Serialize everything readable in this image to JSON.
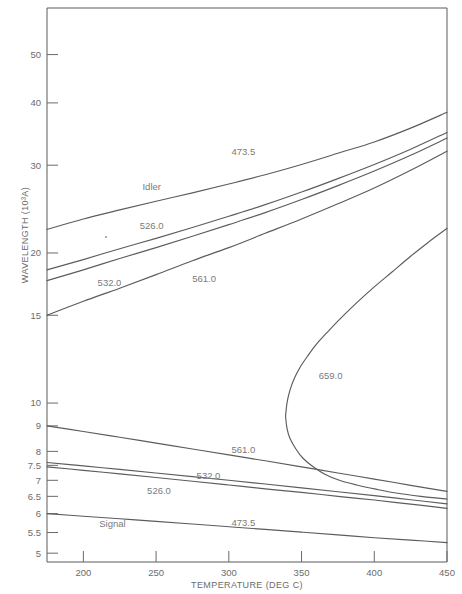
{
  "chart_data": {
    "type": "line",
    "title": "",
    "xlabel": "TEMPERATURE (DEG C)",
    "ylabel": "WAVELENGTH (10³A)",
    "xlim": [
      175,
      450
    ],
    "ylim": [
      4.8,
      62
    ],
    "yscale": "log",
    "grid": false,
    "legend_position": "inline-annotations",
    "xticks": [
      200,
      250,
      300,
      350,
      400,
      450
    ],
    "xtick_labels": [
      "200",
      "250",
      "300",
      "350",
      "400",
      "450"
    ],
    "yticks": [
      5,
      5.5,
      6,
      6.5,
      7,
      7.5,
      8,
      9,
      10,
      15,
      20,
      30,
      40,
      50
    ],
    "ytick_labels": [
      "5",
      "5.5",
      "6",
      "6.5",
      "7",
      "7.5",
      "8",
      "9",
      "10",
      "15",
      "20",
      "30",
      "40",
      "50"
    ],
    "annotations": [
      {
        "text": "Idler",
        "x": 247,
        "y": 26.8,
        "group": "idler"
      },
      {
        "text": "473.5",
        "x": 310,
        "y": 31.5,
        "group": "idler"
      },
      {
        "text": "526.0",
        "x": 247,
        "y": 22.3,
        "group": "idler"
      },
      {
        "text": "532.0",
        "x": 218,
        "y": 17.2,
        "group": "idler"
      },
      {
        "text": "561.0",
        "x": 283,
        "y": 17.5,
        "group": "idler"
      },
      {
        "text": "659.0",
        "x": 370,
        "y": 11.2,
        "group": "idler"
      },
      {
        "text": "561.0",
        "x": 310,
        "y": 7.95,
        "group": "signal"
      },
      {
        "text": "532.0",
        "x": 286,
        "y": 7.05,
        "group": "signal"
      },
      {
        "text": "526.0",
        "x": 252,
        "y": 6.58,
        "group": "signal"
      },
      {
        "text": "Signal",
        "x": 220,
        "y": 5.65,
        "group": "signal"
      },
      {
        "text": "473.5",
        "x": 310,
        "y": 5.68,
        "group": "signal"
      }
    ],
    "series": [
      {
        "name": "idler-473.5",
        "label": "473.5",
        "group": "idler",
        "points": [
          [
            175,
            22.3
          ],
          [
            200,
            23.4
          ],
          [
            225,
            24.4
          ],
          [
            250,
            25.4
          ],
          [
            275,
            26.4
          ],
          [
            300,
            27.5
          ],
          [
            325,
            28.7
          ],
          [
            350,
            30.1
          ],
          [
            375,
            31.7
          ],
          [
            400,
            33.4
          ],
          [
            425,
            35.6
          ],
          [
            450,
            38.3
          ]
        ]
      },
      {
        "name": "idler-526.0",
        "label": "526.0",
        "group": "idler",
        "points": [
          [
            175,
            18.5
          ],
          [
            200,
            19.4
          ],
          [
            225,
            20.4
          ],
          [
            250,
            21.4
          ],
          [
            275,
            22.5
          ],
          [
            300,
            23.7
          ],
          [
            325,
            25.0
          ],
          [
            350,
            26.5
          ],
          [
            375,
            28.2
          ],
          [
            400,
            30.1
          ],
          [
            425,
            32.3
          ],
          [
            450,
            34.9
          ]
        ]
      },
      {
        "name": "idler-532.0",
        "label": "532.0",
        "group": "idler",
        "points": [
          [
            175,
            17.6
          ],
          [
            200,
            18.5
          ],
          [
            225,
            19.5
          ],
          [
            250,
            20.5
          ],
          [
            275,
            21.6
          ],
          [
            300,
            22.8
          ],
          [
            325,
            24.1
          ],
          [
            350,
            25.6
          ],
          [
            375,
            27.3
          ],
          [
            400,
            29.2
          ],
          [
            425,
            31.4
          ],
          [
            450,
            34.0
          ]
        ]
      },
      {
        "name": "idler-561.0",
        "label": "561.0",
        "group": "idler",
        "points": [
          [
            175,
            15.0
          ],
          [
            200,
            16.0
          ],
          [
            225,
            17.0
          ],
          [
            250,
            18.1
          ],
          [
            275,
            19.3
          ],
          [
            300,
            20.5
          ],
          [
            325,
            21.9
          ],
          [
            350,
            23.4
          ],
          [
            375,
            25.1
          ],
          [
            400,
            27.0
          ],
          [
            425,
            29.3
          ],
          [
            450,
            32.0
          ]
        ]
      },
      {
        "name": "idler-659.0-upper",
        "label": "659.0",
        "group": "idler",
        "points": [
          [
            450,
            22.4
          ],
          [
            437,
            21.0
          ],
          [
            425,
            19.7
          ],
          [
            412,
            18.3
          ],
          [
            400,
            17.1
          ],
          [
            388,
            15.9
          ],
          [
            377,
            14.8
          ],
          [
            368,
            13.9
          ],
          [
            360,
            13.1
          ],
          [
            354,
            12.4
          ],
          [
            349,
            11.8
          ],
          [
            345,
            11.2
          ],
          [
            342,
            10.6
          ],
          [
            340,
            10.0
          ],
          [
            339,
            9.4
          ]
        ]
      },
      {
        "name": "idler-659.0-lower",
        "label": "659.0",
        "group": "idler",
        "points": [
          [
            339,
            9.4
          ],
          [
            340,
            8.9
          ],
          [
            342,
            8.5
          ],
          [
            346,
            8.1
          ],
          [
            351,
            7.75
          ],
          [
            358,
            7.45
          ],
          [
            366,
            7.2
          ],
          [
            376,
            7.0
          ],
          [
            388,
            6.85
          ],
          [
            401,
            6.72
          ],
          [
            415,
            6.6
          ],
          [
            432,
            6.5
          ],
          [
            450,
            6.42
          ]
        ]
      },
      {
        "name": "signal-473.5",
        "label": "473.5",
        "group": "signal",
        "points": [
          [
            175,
            6.0
          ],
          [
            200,
            5.93
          ],
          [
            225,
            5.86
          ],
          [
            250,
            5.79
          ],
          [
            275,
            5.72
          ],
          [
            300,
            5.65
          ],
          [
            325,
            5.58
          ],
          [
            350,
            5.51
          ],
          [
            375,
            5.44
          ],
          [
            400,
            5.37
          ],
          [
            425,
            5.31
          ],
          [
            450,
            5.25
          ]
        ]
      },
      {
        "name": "signal-526.0",
        "label": "526.0",
        "group": "signal",
        "points": [
          [
            175,
            7.45
          ],
          [
            200,
            7.33
          ],
          [
            225,
            7.21
          ],
          [
            250,
            7.09
          ],
          [
            275,
            6.97
          ],
          [
            300,
            6.85
          ],
          [
            325,
            6.73
          ],
          [
            350,
            6.62
          ],
          [
            375,
            6.5
          ],
          [
            400,
            6.39
          ],
          [
            425,
            6.27
          ],
          [
            450,
            6.15
          ]
        ]
      },
      {
        "name": "signal-532.0",
        "label": "532.0",
        "group": "signal",
        "points": [
          [
            175,
            7.6
          ],
          [
            200,
            7.48
          ],
          [
            225,
            7.36
          ],
          [
            250,
            7.24
          ],
          [
            275,
            7.12
          ],
          [
            300,
            7.0
          ],
          [
            325,
            6.88
          ],
          [
            350,
            6.76
          ],
          [
            375,
            6.64
          ],
          [
            400,
            6.52
          ],
          [
            425,
            6.4
          ],
          [
            450,
            6.28
          ]
        ]
      },
      {
        "name": "signal-561.0",
        "label": "561.0",
        "group": "signal",
        "points": [
          [
            175,
            9.0
          ],
          [
            200,
            8.77
          ],
          [
            225,
            8.54
          ],
          [
            250,
            8.31
          ],
          [
            275,
            8.09
          ],
          [
            300,
            7.87
          ],
          [
            325,
            7.66
          ],
          [
            350,
            7.45
          ],
          [
            375,
            7.24
          ],
          [
            400,
            7.04
          ],
          [
            425,
            6.84
          ],
          [
            450,
            6.65
          ]
        ]
      }
    ]
  },
  "axes": {
    "x_title": "TEMPERATURE (DEG C)",
    "y_title": "WAVELENGTH (10³A)"
  }
}
